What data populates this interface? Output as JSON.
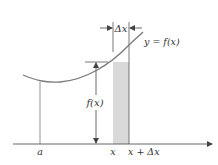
{
  "diagram": {
    "curve_label": "y = f(x)",
    "height_label": "f(x)",
    "width_label": "Δx",
    "axis_labels": {
      "a": "a",
      "x": "x",
      "x_plus_dx": "x + Δx"
    },
    "colors": {
      "curve": "#7a7a7a",
      "lines": "#555555",
      "strip_fill": "#d9d9d9",
      "text": "#333333"
    }
  }
}
